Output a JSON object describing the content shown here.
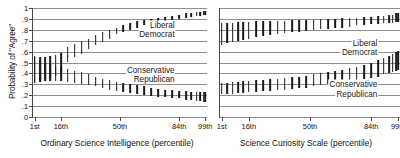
{
  "figure": {
    "ylabel": "Probability of \"Agree\"",
    "ytick_labels": [
      "1",
      ".9",
      ".8",
      ".7",
      ".6",
      ".5",
      ".4",
      ".3",
      ".2",
      ".1",
      "0"
    ],
    "ytick_values": [
      1,
      0.9,
      0.8,
      0.7,
      0.6,
      0.5,
      0.4,
      0.3,
      0.2,
      0.1,
      0
    ],
    "xtick_labels": [
      "1st",
      "16th",
      "50th",
      "84th",
      "99th"
    ],
    "xtick_values": [
      1,
      16,
      50,
      84,
      99
    ],
    "series_colors": {
      "point": "#1a1a1a",
      "grid": "#8e8e8e",
      "axis": "#4a4a4a"
    }
  },
  "panels": [
    {
      "id": "ordinary-science-intelligence",
      "xlabel": "Ordinary Science Intelligence (percentile)",
      "labels": [
        {
          "text": "Liberal",
          "x": 82,
          "y": 0.845
        },
        {
          "text": "Democrat",
          "x": 82,
          "y": 0.76
        },
        {
          "text": "Conservative",
          "x": 82,
          "y": 0.43
        },
        {
          "text": "Republican",
          "x": 82,
          "y": 0.345
        }
      ]
    },
    {
      "id": "science-curiosity-scale",
      "xlabel": "Science Curiosity Scale (percentile)",
      "labels": [
        {
          "text": "Liberal",
          "x": 88,
          "y": 0.68
        },
        {
          "text": "Democrat",
          "x": 88,
          "y": 0.595
        },
        {
          "text": "Conservative",
          "x": 88,
          "y": 0.3
        },
        {
          "text": "Republican",
          "x": 88,
          "y": 0.215
        }
      ]
    }
  ],
  "chart_data": [
    {
      "type": "line",
      "id": "ordinary-science-intelligence",
      "title": "",
      "xlabel": "Ordinary Science Intelligence (percentile)",
      "ylabel": "Probability of \"Agree\"",
      "ylim": [
        0,
        1
      ],
      "xlim": [
        0,
        100
      ],
      "grid": true,
      "legend": "in-plot annotations",
      "xtick_labels": [
        "1st",
        "16th",
        "50th",
        "84th",
        "99th"
      ],
      "x": [
        1,
        4,
        7,
        10,
        13,
        16,
        20,
        24,
        28,
        32,
        36,
        40,
        44,
        48,
        52,
        56,
        60,
        64,
        68,
        72,
        76,
        80,
        84,
        88,
        91,
        94,
        96,
        98,
        99
      ],
      "series": [
        {
          "name": "Liberal Democrat",
          "mean": [
            0.44,
            0.44,
            0.45,
            0.46,
            0.47,
            0.5,
            0.57,
            0.61,
            0.64,
            0.67,
            0.7,
            0.73,
            0.76,
            0.79,
            0.81,
            0.83,
            0.85,
            0.87,
            0.88,
            0.89,
            0.9,
            0.91,
            0.92,
            0.93,
            0.94,
            0.94,
            0.95,
            0.95,
            0.95
          ],
          "lower": [
            0.31,
            0.33,
            0.35,
            0.36,
            0.38,
            0.41,
            0.5,
            0.55,
            0.58,
            0.62,
            0.66,
            0.69,
            0.72,
            0.76,
            0.78,
            0.8,
            0.82,
            0.84,
            0.85,
            0.87,
            0.88,
            0.89,
            0.9,
            0.91,
            0.92,
            0.93,
            0.93,
            0.94,
            0.94
          ],
          "upper": [
            0.56,
            0.55,
            0.55,
            0.56,
            0.57,
            0.59,
            0.64,
            0.67,
            0.7,
            0.72,
            0.75,
            0.78,
            0.8,
            0.82,
            0.84,
            0.86,
            0.88,
            0.89,
            0.9,
            0.91,
            0.92,
            0.93,
            0.94,
            0.95,
            0.95,
            0.96,
            0.96,
            0.97,
            0.97
          ]
        },
        {
          "name": "Conservative Republican",
          "mean": [
            0.43,
            0.42,
            0.42,
            0.41,
            0.4,
            0.4,
            0.38,
            0.37,
            0.35,
            0.34,
            0.32,
            0.31,
            0.29,
            0.28,
            0.27,
            0.26,
            0.25,
            0.24,
            0.23,
            0.22,
            0.22,
            0.21,
            0.21,
            0.2,
            0.2,
            0.2,
            0.19,
            0.19,
            0.19
          ],
          "lower": [
            0.31,
            0.32,
            0.33,
            0.33,
            0.33,
            0.33,
            0.32,
            0.31,
            0.3,
            0.29,
            0.28,
            0.27,
            0.25,
            0.24,
            0.23,
            0.22,
            0.21,
            0.2,
            0.19,
            0.18,
            0.18,
            0.17,
            0.17,
            0.16,
            0.16,
            0.15,
            0.15,
            0.14,
            0.14
          ],
          "upper": [
            0.55,
            0.52,
            0.5,
            0.49,
            0.47,
            0.46,
            0.44,
            0.42,
            0.41,
            0.39,
            0.37,
            0.35,
            0.34,
            0.32,
            0.31,
            0.3,
            0.29,
            0.28,
            0.27,
            0.26,
            0.25,
            0.25,
            0.24,
            0.24,
            0.23,
            0.23,
            0.23,
            0.23,
            0.23
          ]
        }
      ]
    },
    {
      "type": "line",
      "id": "science-curiosity-scale",
      "title": "",
      "xlabel": "Science Curiosity Scale (percentile)",
      "ylabel": "Probability of \"Agree\"",
      "ylim": [
        0,
        1
      ],
      "xlim": [
        0,
        100
      ],
      "grid": true,
      "legend": "in-plot annotations",
      "xtick_labels": [
        "1st",
        "16th",
        "50th",
        "84th",
        "99th"
      ],
      "x": [
        1,
        4,
        7,
        10,
        13,
        16,
        20,
        24,
        28,
        32,
        36,
        40,
        44,
        48,
        52,
        56,
        60,
        64,
        68,
        72,
        76,
        80,
        84,
        88,
        91,
        94,
        96,
        98,
        99
      ],
      "series": [
        {
          "name": "Liberal Democrat",
          "mean": [
            0.77,
            0.78,
            0.78,
            0.79,
            0.79,
            0.8,
            0.8,
            0.81,
            0.81,
            0.82,
            0.82,
            0.83,
            0.83,
            0.84,
            0.84,
            0.85,
            0.85,
            0.86,
            0.86,
            0.87,
            0.87,
            0.88,
            0.88,
            0.89,
            0.89,
            0.9,
            0.9,
            0.91,
            0.91
          ],
          "lower": [
            0.66,
            0.68,
            0.69,
            0.7,
            0.71,
            0.72,
            0.73,
            0.74,
            0.75,
            0.76,
            0.77,
            0.78,
            0.78,
            0.79,
            0.8,
            0.81,
            0.81,
            0.82,
            0.82,
            0.83,
            0.84,
            0.84,
            0.85,
            0.85,
            0.86,
            0.86,
            0.86,
            0.87,
            0.87
          ],
          "upper": [
            0.86,
            0.86,
            0.86,
            0.87,
            0.87,
            0.87,
            0.88,
            0.88,
            0.88,
            0.88,
            0.88,
            0.89,
            0.89,
            0.89,
            0.89,
            0.9,
            0.9,
            0.9,
            0.91,
            0.91,
            0.91,
            0.92,
            0.92,
            0.93,
            0.93,
            0.94,
            0.94,
            0.95,
            0.95
          ]
        },
        {
          "name": "Conservative Republican",
          "mean": [
            0.26,
            0.26,
            0.26,
            0.27,
            0.27,
            0.27,
            0.28,
            0.28,
            0.29,
            0.29,
            0.3,
            0.31,
            0.31,
            0.32,
            0.33,
            0.34,
            0.35,
            0.36,
            0.37,
            0.39,
            0.4,
            0.42,
            0.43,
            0.45,
            0.47,
            0.48,
            0.5,
            0.51,
            0.52
          ],
          "lower": [
            0.21,
            0.21,
            0.21,
            0.22,
            0.22,
            0.23,
            0.23,
            0.24,
            0.24,
            0.25,
            0.25,
            0.26,
            0.27,
            0.27,
            0.28,
            0.29,
            0.3,
            0.31,
            0.32,
            0.33,
            0.34,
            0.35,
            0.36,
            0.37,
            0.39,
            0.4,
            0.41,
            0.42,
            0.43
          ],
          "upper": [
            0.31,
            0.31,
            0.32,
            0.32,
            0.33,
            0.33,
            0.34,
            0.34,
            0.35,
            0.35,
            0.36,
            0.37,
            0.37,
            0.38,
            0.39,
            0.4,
            0.41,
            0.42,
            0.43,
            0.45,
            0.46,
            0.48,
            0.5,
            0.52,
            0.54,
            0.56,
            0.58,
            0.6,
            0.61
          ]
        }
      ]
    }
  ]
}
